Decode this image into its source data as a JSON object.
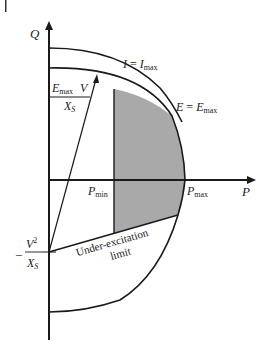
{
  "diagram": {
    "axes": {
      "x_label": "P",
      "y_label": "Q"
    },
    "labels": {
      "current_limit_I": "I",
      "current_limit_eq": "=",
      "current_limit_Imax": "I",
      "current_limit_sub": "max",
      "excitation_E": "E",
      "excitation_eq": "=",
      "excitation_Emax": "E",
      "excitation_sub": "max",
      "phasor_num_E": "E",
      "phasor_num_sub": "max",
      "phasor_num_V": "V",
      "phasor_den_X": "X",
      "phasor_den_sub": "S",
      "pmin": "P",
      "pmin_sub": "min",
      "pmax": "P",
      "pmax_sub": "max",
      "q_offset_minus": "–",
      "q_offset_num": "V",
      "q_offset_sup": "2",
      "q_offset_den": "X",
      "q_offset_den_sub": "S",
      "under_excitation_line1": "Under-excitation",
      "under_excitation_line2": "limit"
    },
    "colors": {
      "line": "#1a1a1a",
      "shaded_region": "#a9a9a9",
      "background": "#ffffff"
    }
  }
}
